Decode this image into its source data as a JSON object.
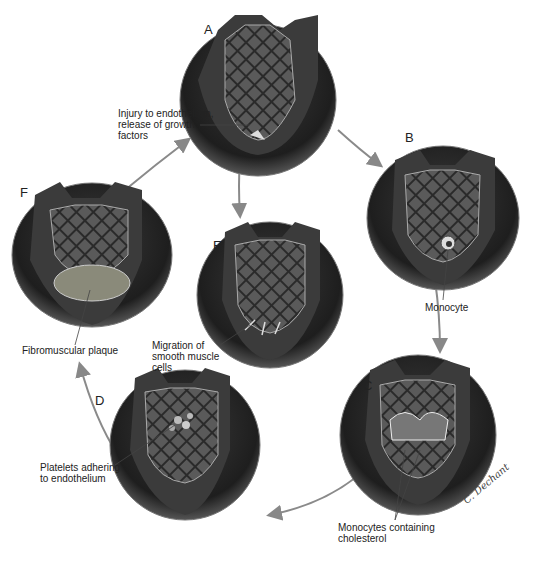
{
  "stages": [
    {
      "letter": "A",
      "label": "Injury to endothelium,\nrelease of growth\nfactors"
    },
    {
      "letter": "B",
      "label": "Monocyte"
    },
    {
      "letter": "C",
      "label": "Monocytes containing\ncholesterol"
    },
    {
      "letter": "D",
      "label": "Platelets adhering\nto endothelium"
    },
    {
      "letter": "E",
      "label": "Migration of\nsmooth muscle\ncells"
    },
    {
      "letter": "F",
      "label": "Fibromuscular plaque"
    }
  ],
  "signature": "C. Dechant"
}
